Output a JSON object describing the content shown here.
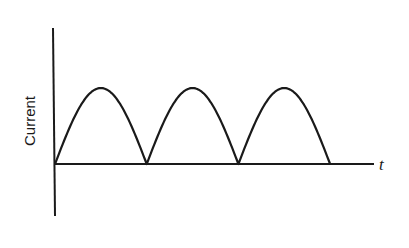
{
  "chart_data": {
    "type": "line",
    "title": "",
    "xlabel": "t",
    "ylabel": "Current",
    "grid": false,
    "legend": null,
    "series": [
      {
        "name": "Current",
        "x": [
          0,
          0.25,
          0.5,
          0.75,
          1.0,
          1.25,
          1.5,
          1.75,
          2.0,
          2.25,
          2.5,
          2.75,
          3.0
        ],
        "values": [
          0,
          0.707,
          1,
          0.707,
          0,
          0.707,
          1,
          0.707,
          0,
          0.707,
          1,
          0.707,
          0
        ]
      }
    ],
    "arches": 3,
    "xlim": [
      0,
      3.5
    ],
    "ylim": [
      -0.65,
      1.2
    ],
    "x_ticks": [],
    "y_ticks": []
  },
  "labels": {
    "y_axis": "Current",
    "x_axis": "t"
  },
  "colors": {
    "line": "#1a1a1a",
    "background": "#ffffff"
  }
}
